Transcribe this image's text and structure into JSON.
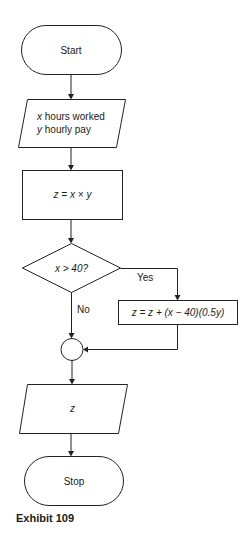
{
  "flowchart": {
    "nodes": {
      "start": {
        "type": "terminator",
        "label": "Start"
      },
      "input": {
        "type": "input-output",
        "line1_var": "x",
        "line1_text": " hours worked",
        "line2_var": "y",
        "line2_text": " hourly pay"
      },
      "compute": {
        "type": "process",
        "label": "z = x × y"
      },
      "decision": {
        "type": "decision",
        "label": "x > 40?"
      },
      "overtime": {
        "type": "process",
        "label": "z = z + (x − 40)(0.5y)"
      },
      "connector": {
        "type": "connector",
        "label": ""
      },
      "output": {
        "type": "input-output",
        "label": "z"
      },
      "stop": {
        "type": "terminator",
        "label": "Stop"
      }
    },
    "edges": {
      "yes_label": "Yes",
      "no_label": "No"
    }
  },
  "caption": "Exhibit 109"
}
